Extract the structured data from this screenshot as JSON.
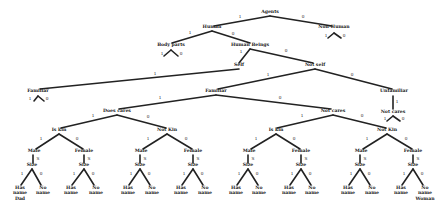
{
  "diagram": {
    "type": "binary decision tree",
    "nodes": [
      {
        "id": "agents",
        "label": "Agents",
        "x": 270,
        "y": 13
      },
      {
        "id": "human",
        "label": "Human",
        "x": 212,
        "y": 28
      },
      {
        "id": "nonhuman",
        "label": "Non-Human",
        "x": 334,
        "y": 28
      },
      {
        "id": "bodyparts",
        "label": "Body parts",
        "x": 171,
        "y": 46
      },
      {
        "id": "humanbeings",
        "label": "Human Beings",
        "x": 250,
        "y": 46
      },
      {
        "id": "self",
        "label": "Self",
        "x": 239,
        "y": 66
      },
      {
        "id": "notself",
        "label": "Not self",
        "x": 315,
        "y": 66
      },
      {
        "id": "familiar_self",
        "label": "Familiar",
        "x": 38,
        "y": 92
      },
      {
        "id": "familiar",
        "label": "Familiar",
        "x": 216,
        "y": 92
      },
      {
        "id": "unfamiliar",
        "label": "Unfamiliar",
        "x": 394,
        "y": 92
      },
      {
        "id": "notcares_u",
        "label": "Not cares",
        "x": 393,
        "y": 113
      },
      {
        "id": "doescares",
        "label": "Does cares",
        "x": 117,
        "y": 112
      },
      {
        "id": "notcares",
        "label": "Not cares",
        "x": 333,
        "y": 112
      },
      {
        "id": "iskin_a",
        "label": "Is kin",
        "x": 59,
        "y": 131
      },
      {
        "id": "notkin_a",
        "label": "Not Kin",
        "x": 167,
        "y": 131
      },
      {
        "id": "iskin_b",
        "label": "Is kin",
        "x": 276,
        "y": 131
      },
      {
        "id": "notkin_b",
        "label": "Not Kin",
        "x": 387,
        "y": 131
      },
      {
        "id": "male_a",
        "label": "Male",
        "x": 34,
        "y": 152
      },
      {
        "id": "female_a",
        "label": "Female",
        "x": 84,
        "y": 152
      },
      {
        "id": "male_b",
        "label": "Male",
        "x": 141,
        "y": 152
      },
      {
        "id": "female_b",
        "label": "Female",
        "x": 193,
        "y": 152
      },
      {
        "id": "male_c",
        "label": "Male",
        "x": 249,
        "y": 152
      },
      {
        "id": "female_c",
        "label": "Female",
        "x": 301,
        "y": 152
      },
      {
        "id": "male_d",
        "label": "Male",
        "x": 361,
        "y": 152
      },
      {
        "id": "female_d",
        "label": "Female",
        "x": 413,
        "y": 152
      },
      {
        "id": "size_a",
        "label": "Size",
        "x": 32,
        "y": 166
      },
      {
        "id": "size_b",
        "label": "Size",
        "x": 84,
        "y": 166
      },
      {
        "id": "size_c",
        "label": "Size",
        "x": 140,
        "y": 166
      },
      {
        "id": "size_d",
        "label": "Size",
        "x": 193,
        "y": 166
      },
      {
        "id": "size_e",
        "label": "Size",
        "x": 248,
        "y": 166
      },
      {
        "id": "size_f",
        "label": "Size",
        "x": 301,
        "y": 166
      },
      {
        "id": "size_g",
        "label": "Size",
        "x": 360,
        "y": 166
      },
      {
        "id": "size_h",
        "label": "Size",
        "x": 413,
        "y": 166
      }
    ],
    "leaves": [
      {
        "lines": [
          "Has",
          "name",
          "Dad"
        ],
        "x": 20,
        "y": 189
      },
      {
        "lines": [
          "No",
          "name"
        ],
        "x": 43,
        "y": 189
      },
      {
        "lines": [
          "Has",
          "name"
        ],
        "x": 71,
        "y": 189
      },
      {
        "lines": [
          "No",
          "name"
        ],
        "x": 96,
        "y": 189
      },
      {
        "lines": [
          "Has",
          "name"
        ],
        "x": 128,
        "y": 189
      },
      {
        "lines": [
          "No",
          "name"
        ],
        "x": 152,
        "y": 189
      },
      {
        "lines": [
          "Has",
          "name"
        ],
        "x": 181,
        "y": 189
      },
      {
        "lines": [
          "No",
          "name"
        ],
        "x": 205,
        "y": 189
      },
      {
        "lines": [
          "Has",
          "name"
        ],
        "x": 236,
        "y": 189
      },
      {
        "lines": [
          "No",
          "name"
        ],
        "x": 259,
        "y": 189
      },
      {
        "lines": [
          "Has",
          "name"
        ],
        "x": 289,
        "y": 189
      },
      {
        "lines": [
          "No",
          "name"
        ],
        "x": 312,
        "y": 189
      },
      {
        "lines": [
          "Has",
          "name"
        ],
        "x": 348,
        "y": 189
      },
      {
        "lines": [
          "No",
          "name"
        ],
        "x": 372,
        "y": 189
      },
      {
        "lines": [
          "Has",
          "name"
        ],
        "x": 401,
        "y": 189
      },
      {
        "lines": [
          "No",
          "name",
          "Woman"
        ],
        "x": 425,
        "y": 189
      }
    ],
    "edges": [
      {
        "x1": 270,
        "y1": 16,
        "x2": 214,
        "y2": 26,
        "label": "1",
        "lx": 240,
        "ly": 18
      },
      {
        "x1": 270,
        "y1": 16,
        "x2": 332,
        "y2": 26,
        "label": "0",
        "lx": 303,
        "ly": 18
      },
      {
        "x1": 328,
        "y1": 38,
        "x2": 334,
        "y2": 33,
        "label": "",
        "lx": 0,
        "ly": 0
      },
      {
        "x1": 334,
        "y1": 33,
        "x2": 341,
        "y2": 38,
        "label": "",
        "lx": 0,
        "ly": 0
      },
      {
        "x1": 212,
        "y1": 31,
        "x2": 172,
        "y2": 43,
        "label": "1",
        "lx": 190,
        "ly": 34
      },
      {
        "x1": 212,
        "y1": 31,
        "x2": 250,
        "y2": 43,
        "label": "0",
        "lx": 233,
        "ly": 35
      },
      {
        "x1": 164,
        "y1": 56,
        "x2": 171,
        "y2": 50,
        "label": "",
        "lx": 0,
        "ly": 0
      },
      {
        "x1": 171,
        "y1": 50,
        "x2": 178,
        "y2": 56,
        "label": "",
        "lx": 0,
        "ly": 0
      },
      {
        "x1": 250,
        "y1": 49,
        "x2": 239,
        "y2": 63,
        "label": "1",
        "lx": 241,
        "ly": 53
      },
      {
        "x1": 250,
        "y1": 49,
        "x2": 313,
        "y2": 63,
        "label": "0",
        "lx": 286,
        "ly": 52
      },
      {
        "x1": 239,
        "y1": 69,
        "x2": 40,
        "y2": 89,
        "label": "1",
        "lx": 155,
        "ly": 75
      },
      {
        "x1": 34,
        "y1": 101,
        "x2": 38,
        "y2": 96,
        "label": "",
        "lx": 0,
        "ly": 0
      },
      {
        "x1": 38,
        "y1": 96,
        "x2": 44,
        "y2": 101,
        "label": "",
        "lx": 0,
        "ly": 0
      },
      {
        "x1": 315,
        "y1": 69,
        "x2": 218,
        "y2": 89,
        "label": "1",
        "lx": 268,
        "ly": 76
      },
      {
        "x1": 315,
        "y1": 69,
        "x2": 392,
        "y2": 89,
        "label": "0",
        "lx": 352,
        "ly": 76
      },
      {
        "x1": 393,
        "y1": 96,
        "x2": 393,
        "y2": 109,
        "label": "1",
        "lx": 397,
        "ly": 103
      },
      {
        "x1": 387,
        "y1": 121,
        "x2": 393,
        "y2": 116,
        "label": "",
        "lx": 0,
        "ly": 0
      },
      {
        "x1": 393,
        "y1": 116,
        "x2": 400,
        "y2": 121,
        "label": "",
        "lx": 0,
        "ly": 0
      },
      {
        "x1": 216,
        "y1": 95,
        "x2": 119,
        "y2": 109,
        "label": "1",
        "lx": 160,
        "ly": 99
      },
      {
        "x1": 216,
        "y1": 95,
        "x2": 331,
        "y2": 109,
        "label": "0",
        "lx": 280,
        "ly": 99
      },
      {
        "x1": 117,
        "y1": 115,
        "x2": 61,
        "y2": 128,
        "label": "1",
        "lx": 93,
        "ly": 117
      },
      {
        "x1": 117,
        "y1": 115,
        "x2": 166,
        "y2": 128,
        "label": "0",
        "lx": 148,
        "ly": 118
      },
      {
        "x1": 333,
        "y1": 115,
        "x2": 277,
        "y2": 128,
        "label": "1",
        "lx": 302,
        "ly": 117
      },
      {
        "x1": 333,
        "y1": 115,
        "x2": 386,
        "y2": 128,
        "label": "0",
        "lx": 362,
        "ly": 117
      },
      {
        "x1": 59,
        "y1": 134,
        "x2": 36,
        "y2": 149,
        "label": "1",
        "lx": 41,
        "ly": 140
      },
      {
        "x1": 59,
        "y1": 134,
        "x2": 83,
        "y2": 149,
        "label": "0",
        "lx": 77,
        "ly": 140
      },
      {
        "x1": 167,
        "y1": 134,
        "x2": 143,
        "y2": 149,
        "label": "1",
        "lx": 148,
        "ly": 140
      },
      {
        "x1": 167,
        "y1": 134,
        "x2": 192,
        "y2": 149,
        "label": "0",
        "lx": 186,
        "ly": 140
      },
      {
        "x1": 276,
        "y1": 134,
        "x2": 251,
        "y2": 149,
        "label": "1",
        "lx": 256,
        "ly": 140
      },
      {
        "x1": 276,
        "y1": 134,
        "x2": 300,
        "y2": 149,
        "label": "0",
        "lx": 294,
        "ly": 140
      },
      {
        "x1": 387,
        "y1": 134,
        "x2": 363,
        "y2": 149,
        "label": "1",
        "lx": 367,
        "ly": 140
      },
      {
        "x1": 387,
        "y1": 134,
        "x2": 412,
        "y2": 149,
        "label": "0",
        "lx": 406,
        "ly": 140
      },
      {
        "x1": 33,
        "y1": 155,
        "x2": 33,
        "y2": 163,
        "label": "S",
        "lx": 38,
        "ly": 160
      },
      {
        "x1": 84,
        "y1": 155,
        "x2": 84,
        "y2": 163,
        "label": "S",
        "lx": 89,
        "ly": 160
      },
      {
        "x1": 140,
        "y1": 155,
        "x2": 140,
        "y2": 163,
        "label": "S",
        "lx": 145,
        "ly": 160
      },
      {
        "x1": 193,
        "y1": 155,
        "x2": 193,
        "y2": 163,
        "label": "S",
        "lx": 198,
        "ly": 160
      },
      {
        "x1": 248,
        "y1": 155,
        "x2": 248,
        "y2": 163,
        "label": "S",
        "lx": 253,
        "ly": 160
      },
      {
        "x1": 301,
        "y1": 155,
        "x2": 301,
        "y2": 163,
        "label": "S",
        "lx": 306,
        "ly": 160
      },
      {
        "x1": 360,
        "y1": 155,
        "x2": 360,
        "y2": 163,
        "label": "S",
        "lx": 365,
        "ly": 160
      },
      {
        "x1": 413,
        "y1": 155,
        "x2": 413,
        "y2": 163,
        "label": "S",
        "lx": 418,
        "ly": 160
      },
      {
        "x1": 32,
        "y1": 169,
        "x2": 21,
        "y2": 185,
        "label": "1",
        "lx": 22,
        "ly": 175
      },
      {
        "x1": 32,
        "y1": 169,
        "x2": 41,
        "y2": 185,
        "label": "0",
        "lx": 41,
        "ly": 175
      },
      {
        "x1": 84,
        "y1": 169,
        "x2": 72,
        "y2": 185,
        "label": "1",
        "lx": 74,
        "ly": 175
      },
      {
        "x1": 84,
        "y1": 169,
        "x2": 94,
        "y2": 185,
        "label": "0",
        "lx": 93,
        "ly": 175
      },
      {
        "x1": 140,
        "y1": 169,
        "x2": 129,
        "y2": 185,
        "label": "1",
        "lx": 131,
        "ly": 175
      },
      {
        "x1": 140,
        "y1": 169,
        "x2": 150,
        "y2": 185,
        "label": "0",
        "lx": 149,
        "ly": 175
      },
      {
        "x1": 193,
        "y1": 169,
        "x2": 182,
        "y2": 185,
        "label": "1",
        "lx": 184,
        "ly": 175
      },
      {
        "x1": 193,
        "y1": 169,
        "x2": 203,
        "y2": 185,
        "label": "0",
        "lx": 202,
        "ly": 175
      },
      {
        "x1": 248,
        "y1": 169,
        "x2": 237,
        "y2": 185,
        "label": "1",
        "lx": 239,
        "ly": 175
      },
      {
        "x1": 248,
        "y1": 169,
        "x2": 258,
        "y2": 185,
        "label": "0",
        "lx": 257,
        "ly": 175
      },
      {
        "x1": 301,
        "y1": 169,
        "x2": 290,
        "y2": 185,
        "label": "1",
        "lx": 292,
        "ly": 175
      },
      {
        "x1": 301,
        "y1": 169,
        "x2": 311,
        "y2": 185,
        "label": "0",
        "lx": 310,
        "ly": 175
      },
      {
        "x1": 360,
        "y1": 169,
        "x2": 349,
        "y2": 185,
        "label": "1",
        "lx": 351,
        "ly": 175
      },
      {
        "x1": 360,
        "y1": 169,
        "x2": 370,
        "y2": 185,
        "label": "0",
        "lx": 369,
        "ly": 175
      },
      {
        "x1": 413,
        "y1": 169,
        "x2": 402,
        "y2": 185,
        "label": "1",
        "lx": 404,
        "ly": 175
      },
      {
        "x1": 413,
        "y1": 169,
        "x2": 423,
        "y2": 185,
        "label": "0",
        "lx": 422,
        "ly": 175
      }
    ],
    "side_labels": [
      {
        "text": "1",
        "x": 326,
        "y": 37
      },
      {
        "text": "0",
        "x": 344,
        "y": 37
      },
      {
        "text": "1",
        "x": 162,
        "y": 55
      },
      {
        "text": "0",
        "x": 181,
        "y": 55
      },
      {
        "text": "1",
        "x": 30,
        "y": 100
      },
      {
        "text": "0",
        "x": 47,
        "y": 100
      },
      {
        "text": "1",
        "x": 385,
        "y": 120
      },
      {
        "text": "0",
        "x": 403,
        "y": 120
      }
    ]
  }
}
